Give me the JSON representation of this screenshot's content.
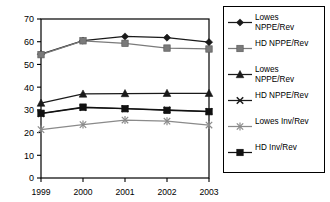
{
  "chart_data": {
    "type": "line",
    "title": "",
    "subtitle": "",
    "xlabel": "",
    "ylabel": "",
    "categories": [
      "1999",
      "2000",
      "2001",
      "2002",
      "2003"
    ],
    "x_tick_labels": [
      "1999",
      "2000",
      "2001",
      "2002",
      "2003"
    ],
    "y_tick_labels": [
      "0",
      "10",
      "20",
      "30",
      "40",
      "50",
      "60",
      "70"
    ],
    "y_ticks": [
      0,
      10,
      20,
      30,
      40,
      50,
      60,
      70
    ],
    "ylim": [
      0,
      70
    ],
    "grid": false,
    "legend_position": "right",
    "series": [
      {
        "name": "Lowes NPPE/Rev",
        "label": "Lowes\nNPPE/Rev",
        "marker": "diamond",
        "color": "#1a1a1a",
        "values": [
          54.5,
          60.5,
          62.3,
          61.8,
          59.8
        ]
      },
      {
        "name": "HD NPPE/Rev",
        "label": "HD NPPE/Rev",
        "marker": "square",
        "color": "#7a7a7a",
        "values": [
          54.3,
          60.4,
          59.3,
          57.2,
          56.8
        ]
      },
      {
        "name": "Lowes NPPE/Rev (2)",
        "label": "Lowes\nNPPE/Rev",
        "marker": "triangle",
        "color": "#1a1a1a",
        "values": [
          33.0,
          37.0,
          37.2,
          37.3,
          37.3
        ]
      },
      {
        "name": "HD NPPE/Rev (2)",
        "label": "HD NPPE/Rev",
        "marker": "x",
        "color": "#1a1a1a",
        "values": [
          28.3,
          31.0,
          30.5,
          30.0,
          29.3
        ]
      },
      {
        "name": "Lowes Inv/Rev",
        "label": "Lowes Inv/Rev",
        "marker": "asterisk",
        "color": "#8a8a8a",
        "values": [
          21.3,
          23.5,
          25.5,
          25.0,
          23.3
        ]
      },
      {
        "name": "HD Inv/Rev",
        "label": "HD Inv/Rev",
        "marker": "filled-square",
        "color": "#111111",
        "values": [
          28.5,
          31.2,
          30.5,
          29.8,
          29.2
        ]
      }
    ]
  },
  "legend": {
    "items": [
      {
        "label": "Lowes\nNPPE/Rev",
        "marker": "diamond-marker-icon"
      },
      {
        "label": "HD NPPE/Rev",
        "marker": "square-marker-icon"
      },
      {
        "label": "Lowes\nNPPE/Rev",
        "marker": "triangle-marker-icon"
      },
      {
        "label": "HD NPPE/Rev",
        "marker": "x-marker-icon"
      },
      {
        "label": "Lowes Inv/Rev",
        "marker": "asterisk-marker-icon"
      },
      {
        "label": "HD Inv/Rev",
        "marker": "filled-square-marker-icon"
      }
    ]
  },
  "colors": {
    "axis": "#000000",
    "dark_series": "#1a1a1a",
    "gray_series": "#7a7a7a",
    "background": "#ffffff"
  }
}
